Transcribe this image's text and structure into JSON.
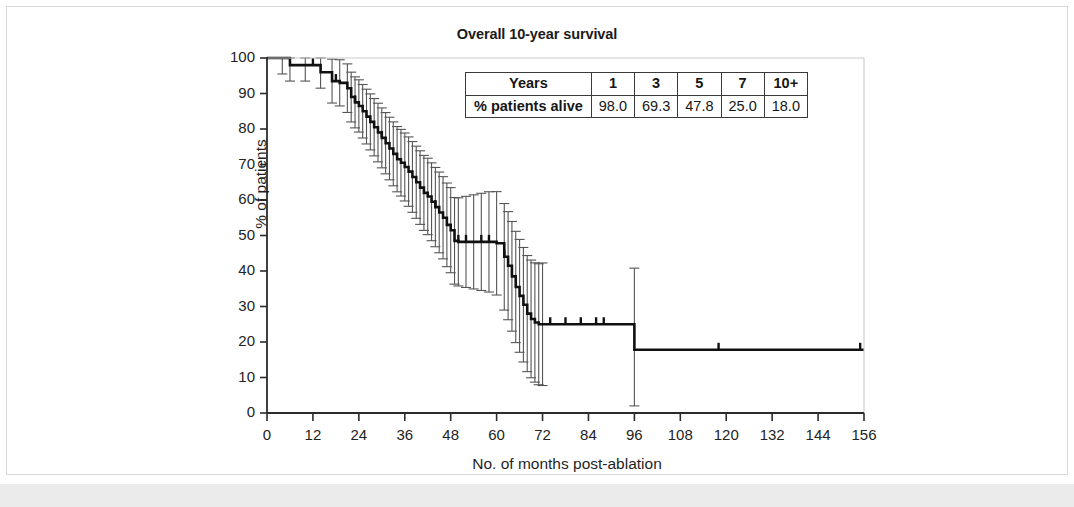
{
  "figure": {
    "title": "Overall 10-year survival",
    "background_color": "#ffffff",
    "frame_color": "#d9d9d9",
    "band_color": "#ebebeb",
    "curve_color": "#111111",
    "ci_color": "#555555"
  },
  "summary_table": {
    "row_header_1": "Years",
    "row_header_2": "% patients alive",
    "year_labels": [
      "1",
      "3",
      "5",
      "7",
      "10+"
    ],
    "percent_alive": [
      "98.0",
      "69.3",
      "47.8",
      "25.0",
      "18.0"
    ]
  },
  "chart_data": {
    "type": "line",
    "subtype": "kaplan-meier-survival",
    "title": "Overall 10-year survival",
    "xlabel": "No. of months post-ablation",
    "ylabel": "% of patients",
    "xlim": [
      0,
      156
    ],
    "ylim": [
      0,
      100
    ],
    "xticks": [
      0,
      12,
      24,
      36,
      48,
      60,
      72,
      84,
      96,
      108,
      120,
      132,
      144,
      156
    ],
    "yticks": [
      0,
      10,
      20,
      30,
      40,
      50,
      60,
      70,
      80,
      90,
      100
    ],
    "grid": false,
    "legend": "none",
    "series": [
      {
        "name": "Overall survival",
        "style": "step-post",
        "x": [
          0,
          4,
          6,
          10,
          14,
          17,
          19,
          21,
          22,
          23,
          24,
          25,
          26,
          27,
          28,
          29,
          30,
          31,
          32,
          33,
          34,
          35,
          36,
          37,
          38,
          39,
          40,
          41,
          42,
          43,
          44,
          45,
          46,
          47,
          48,
          49,
          50,
          52,
          54,
          56,
          58,
          60,
          62,
          63,
          64,
          65,
          66,
          67,
          68,
          69,
          70,
          71,
          72,
          96,
          156
        ],
        "y": [
          100.0,
          100.0,
          98.0,
          98.0,
          96.0,
          93.5,
          93.0,
          91.5,
          89.0,
          87.5,
          86.5,
          85.0,
          83.5,
          82.0,
          80.5,
          79.0,
          77.5,
          76.0,
          74.5,
          73.0,
          71.5,
          70.5,
          69.3,
          68.0,
          66.5,
          65.0,
          63.5,
          62.0,
          61.0,
          59.5,
          58.0,
          56.5,
          55.0,
          53.0,
          51.5,
          48.5,
          48.2,
          48.2,
          48.2,
          48.2,
          48.2,
          47.8,
          44.0,
          41.5,
          38.5,
          35.5,
          33.0,
          30.5,
          28.0,
          26.5,
          25.5,
          25.0,
          25.0,
          17.8,
          17.8
        ]
      }
    ],
    "censor_marks_months": [
      12,
      18,
      23,
      30,
      44,
      50,
      52,
      56,
      58,
      62,
      74,
      78,
      82,
      86,
      88,
      118,
      155
    ],
    "confidence_interval": {
      "level": "95%",
      "description": "vertical error bars with caps at each event time"
    },
    "key_timepoints": [
      {
        "years": 1,
        "months": 12,
        "percent_alive": 98.0
      },
      {
        "years": 3,
        "months": 36,
        "percent_alive": 69.3
      },
      {
        "years": 5,
        "months": 60,
        "percent_alive": 47.8
      },
      {
        "years": 7,
        "months": 84,
        "percent_alive": 25.0
      },
      {
        "years": "10+",
        "months": 120,
        "percent_alive": 18.0
      }
    ]
  }
}
